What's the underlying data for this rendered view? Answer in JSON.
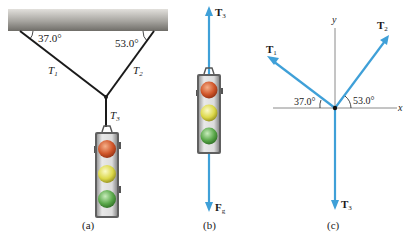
{
  "figure": {
    "panels": [
      {
        "id": "a",
        "label": "(a)",
        "angles": {
          "left": "37.0°",
          "right": "53.0°"
        },
        "ropes": [
          {
            "symbol": "T",
            "subscript": "1"
          },
          {
            "symbol": "T",
            "subscript": "2"
          },
          {
            "symbol": "T",
            "subscript": "3"
          }
        ],
        "object": "traffic-light"
      },
      {
        "id": "b",
        "label": "(b)",
        "forces": [
          {
            "symbol": "T",
            "subscript": "3",
            "direction": "up"
          },
          {
            "symbol": "F",
            "subscript": "g",
            "direction": "down"
          }
        ],
        "object": "traffic-light"
      },
      {
        "id": "c",
        "label": "(c)",
        "axes": {
          "x": "x",
          "y": "y"
        },
        "angles": {
          "left": "37.0°",
          "right": "53.0°"
        },
        "forces": [
          {
            "symbol": "T",
            "subscript": "1"
          },
          {
            "symbol": "T",
            "subscript": "2"
          },
          {
            "symbol": "T",
            "subscript": "3"
          }
        ]
      }
    ],
    "colors": {
      "vector": "#3fa0d8",
      "rope": "#1a1a1a",
      "axis": "#8a8a8a",
      "ceiling_light": "#d8d6d2",
      "ceiling_dark": "#7d7b76",
      "light_red": "#d0562a",
      "light_yellow": "#dcd84a",
      "light_green": "#5aa84a",
      "housing": "#cfcfcf"
    }
  }
}
